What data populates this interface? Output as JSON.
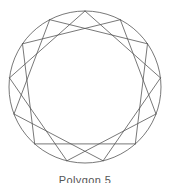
{
  "figure": {
    "caption": "Polygon 5",
    "background_color": "#ffffff",
    "stroke_color": "#555555",
    "circle_stroke_color": "#555555",
    "stroke_width": 0.8
  },
  "chart_data": {
    "type": "scatter",
    "title": "Polygon 5",
    "xlabel": "",
    "ylabel": "",
    "grid": false,
    "legend_position": "none",
    "geometry": {
      "shape": "star-polygon",
      "vertex_count": 13,
      "step": 3,
      "schlafli_symbol": "{13/3}",
      "center_x": 85,
      "center_y": 87,
      "radius": 76,
      "start_angle_deg": -90,
      "chord_count": 13,
      "circumscribed_circle": true
    },
    "vertices": [
      {
        "index": 0,
        "angle_deg": -90.0,
        "x": 85.0,
        "y": 11.0
      },
      {
        "index": 1,
        "angle_deg": -62.3,
        "x": 120.3,
        "y": 19.7
      },
      {
        "index": 2,
        "angle_deg": -34.6,
        "x": 147.5,
        "y": 43.8
      },
      {
        "index": 3,
        "angle_deg": -6.9,
        "x": 160.5,
        "y": 77.9
      },
      {
        "index": 4,
        "angle_deg": 20.8,
        "x": 156.0,
        "y": 114.0
      },
      {
        "index": 5,
        "angle_deg": 48.5,
        "x": 135.3,
        "y": 143.9
      },
      {
        "index": 6,
        "angle_deg": 76.2,
        "x": 103.1,
        "y": 160.8
      },
      {
        "index": 7,
        "angle_deg": 103.8,
        "x": 66.9,
        "y": 160.8
      },
      {
        "index": 8,
        "angle_deg": 131.5,
        "x": 34.7,
        "y": 143.9
      },
      {
        "index": 9,
        "angle_deg": 159.2,
        "x": 14.0,
        "y": 114.0
      },
      {
        "index": 10,
        "angle_deg": 186.9,
        "x": 9.5,
        "y": 77.9
      },
      {
        "index": 11,
        "angle_deg": 214.6,
        "x": 22.5,
        "y": 43.8
      },
      {
        "index": 12,
        "angle_deg": 242.3,
        "x": 49.7,
        "y": 19.7
      }
    ],
    "chords": [
      {
        "from": 0,
        "to": 3
      },
      {
        "from": 1,
        "to": 4
      },
      {
        "from": 2,
        "to": 5
      },
      {
        "from": 3,
        "to": 6
      },
      {
        "from": 4,
        "to": 7
      },
      {
        "from": 5,
        "to": 8
      },
      {
        "from": 6,
        "to": 9
      },
      {
        "from": 7,
        "to": 10
      },
      {
        "from": 8,
        "to": 11
      },
      {
        "from": 9,
        "to": 12
      },
      {
        "from": 10,
        "to": 0
      },
      {
        "from": 11,
        "to": 1
      },
      {
        "from": 12,
        "to": 2
      }
    ]
  }
}
